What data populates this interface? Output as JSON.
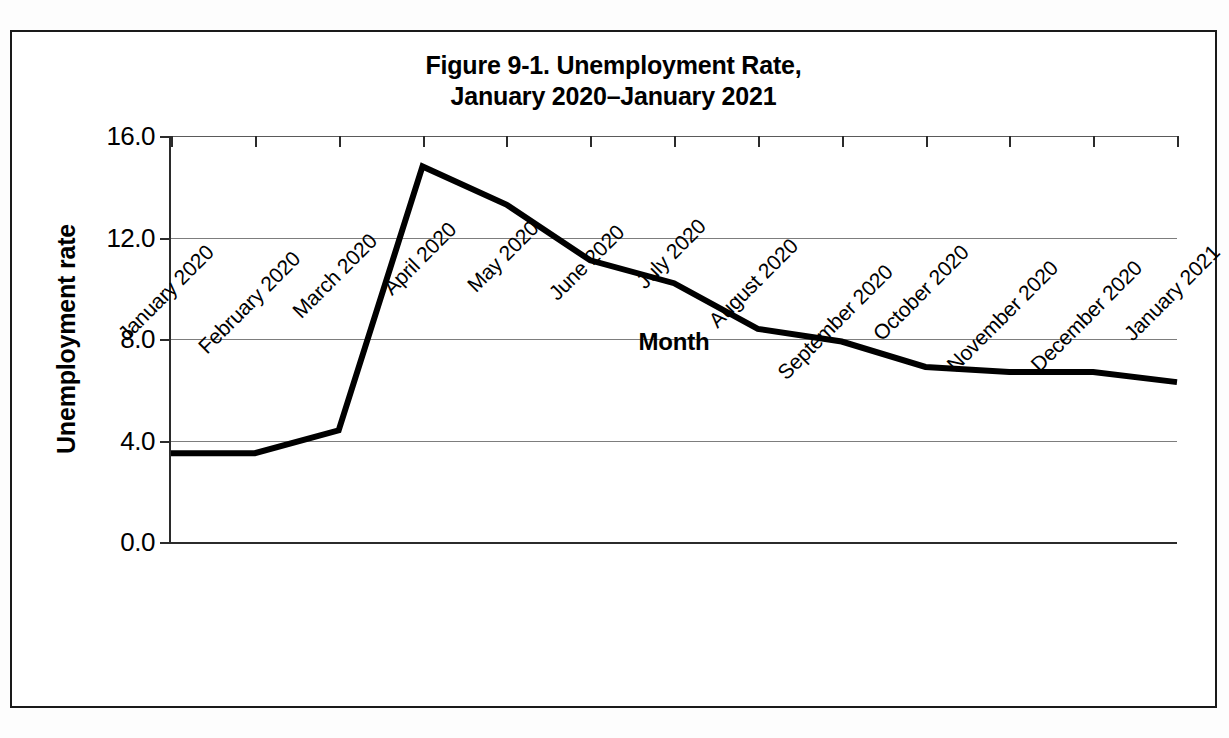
{
  "figure": {
    "title_line1": "Figure 9-1. Unemployment Rate,",
    "title_line2": "January 2020–January 2021",
    "border_color": "#1a1a1a",
    "background": "#ffffff"
  },
  "axes": {
    "y_title": "Unemployment rate",
    "x_title": "Month",
    "y_ticks": [
      "16.0",
      "12.0",
      "8.0",
      "4.0",
      "0.0"
    ],
    "axis_color": "#2b2b2b",
    "grid_color": "#7d7d7d"
  },
  "chart_data": {
    "type": "line",
    "title": "Figure 9-1. Unemployment Rate, January 2020–January 2021",
    "xlabel": "Month",
    "ylabel": "Unemployment rate",
    "ylim": [
      0.0,
      16.0
    ],
    "ytick_interval": 4.0,
    "grid": true,
    "legend": false,
    "line_color": "#000000",
    "line_width_px": 6,
    "categories": [
      "January 2020",
      "February 2020",
      "March 2020",
      "April 2020",
      "May 2020",
      "June 2020",
      "July 2020",
      "August 2020",
      "September 2020",
      "October 2020",
      "November 2020",
      "December 2020",
      "January 2021"
    ],
    "values": [
      3.5,
      3.5,
      4.4,
      14.8,
      13.3,
      11.1,
      10.2,
      8.4,
      7.9,
      6.9,
      6.7,
      6.7,
      6.3
    ],
    "series": [
      {
        "name": "Unemployment rate",
        "values": [
          3.5,
          3.5,
          4.4,
          14.8,
          13.3,
          11.1,
          10.2,
          8.4,
          7.9,
          6.9,
          6.7,
          6.7,
          6.3
        ]
      }
    ]
  }
}
